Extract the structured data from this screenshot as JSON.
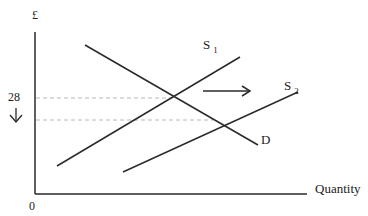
{
  "diagram": {
    "type": "supply-demand",
    "y_axis_label": "£",
    "x_axis_label": "Quantity",
    "origin_label": "0",
    "price_label": "28",
    "price_change_arrow": "↓",
    "curves": {
      "demand": "D",
      "supply1": "S",
      "supply1_sub": "1",
      "supply2": "S",
      "supply2_sub": "2"
    },
    "shift_arrow": "supply shift right",
    "colors": {
      "line": "#2a2a2a",
      "dashed": "#b8b8b8",
      "text": "#222222"
    }
  }
}
